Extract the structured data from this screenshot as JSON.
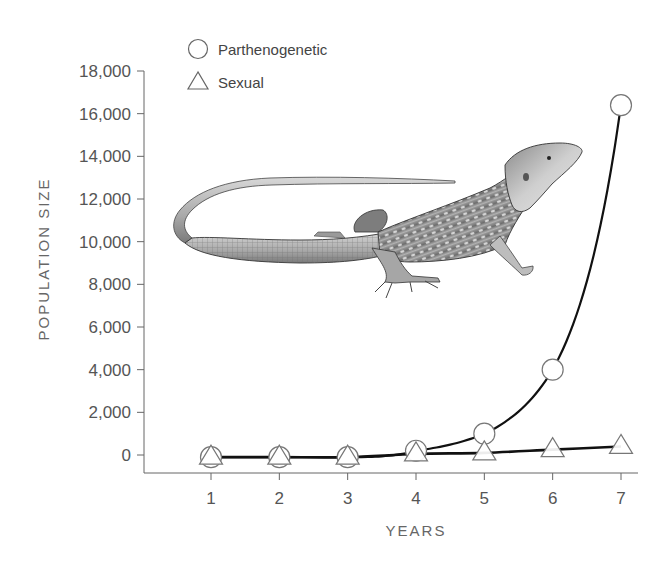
{
  "chart_data": {
    "type": "line",
    "title": "",
    "xlabel": "YEARS",
    "ylabel": "POPULATION SIZE",
    "x": [
      1,
      2,
      3,
      4,
      5,
      6,
      7
    ],
    "x_tick_labels": [
      "1",
      "2",
      "3",
      "4",
      "5",
      "6",
      "7"
    ],
    "y_tick_values": [
      0,
      2000,
      4000,
      6000,
      8000,
      10000,
      12000,
      14000,
      16000,
      18000
    ],
    "y_tick_labels": [
      "0",
      "2,000",
      "4,000",
      "6,000",
      "8,000",
      "10,000",
      "12,000",
      "14,000",
      "16,000",
      "18,000"
    ],
    "ylim": [
      -800,
      18000
    ],
    "xlim": [
      0,
      7.25
    ],
    "grid": false,
    "legend_position": "top-left",
    "series": [
      {
        "name": "Parthenogenetic",
        "marker": "circle",
        "values": [
          -100,
          -100,
          -100,
          200,
          1000,
          4000,
          16400
        ]
      },
      {
        "name": "Sexual",
        "marker": "triangle",
        "values": [
          -100,
          -100,
          -100,
          50,
          100,
          250,
          400
        ]
      }
    ],
    "annotations": [
      "Illustration of a whiptail lizard overlaid on the chart area"
    ]
  },
  "legend": {
    "items": [
      {
        "label": "Parthenogenetic",
        "marker": "circle"
      },
      {
        "label": "Sexual",
        "marker": "triangle"
      }
    ]
  },
  "illustration": {
    "subject": "lizard"
  },
  "colors": {
    "line": "#1a1a1a",
    "axis": "#555555",
    "marker_fill": "#ffffff",
    "marker_stroke": "#777777",
    "text": "#555555"
  }
}
